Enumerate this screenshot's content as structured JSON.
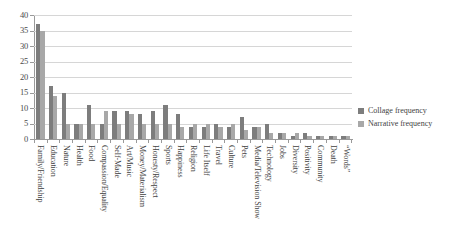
{
  "chart_data": {
    "type": "bar",
    "title": "",
    "xlabel": "",
    "ylabel": "",
    "ylim": [
      0,
      40
    ],
    "yticks": [
      0,
      5,
      10,
      15,
      20,
      25,
      30,
      35,
      40
    ],
    "grid": true,
    "legend_position": "right",
    "categories": [
      "Family/Friendship",
      "Education",
      "Nature",
      "Health",
      "Food",
      "Compassion/Equality",
      "Self-Made",
      "Art/Music",
      "Money/Materialism",
      "Honesty/Respect",
      "Sports",
      "Happiness",
      "Religion",
      "Life Itself",
      "Travel",
      "Culture",
      "Pets",
      "Media/Television Show",
      "Technology",
      "Jobs",
      "Diversity",
      "Positivity",
      "Community",
      "Death",
      "“Words”"
    ],
    "series": [
      {
        "name": "Collage frequency",
        "color": "#7d7d7d",
        "values": [
          37,
          17,
          15,
          5,
          11,
          5,
          9,
          9,
          8,
          9,
          11,
          8,
          4,
          4,
          5,
          4,
          7,
          4,
          5,
          2,
          1,
          2,
          1,
          1,
          1
        ]
      },
      {
        "name": "Narrative frequency",
        "color": "#a8a8a8",
        "values": [
          35,
          14,
          5,
          5,
          5,
          9,
          5,
          8,
          5,
          5,
          5,
          4,
          5,
          5,
          4,
          5,
          3,
          4,
          2,
          2,
          2,
          1,
          1,
          1,
          1
        ]
      }
    ]
  },
  "legend": {
    "items": [
      {
        "label": "Collage frequency",
        "color": "#7d7d7d"
      },
      {
        "label": "Narrative frequency",
        "color": "#a8a8a8"
      }
    ]
  },
  "axis": {
    "y_max_label": "40",
    "y_min_label": "0"
  }
}
